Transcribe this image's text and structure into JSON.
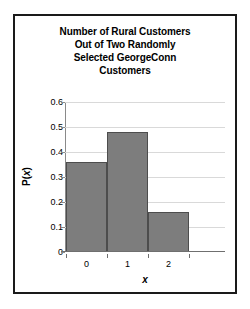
{
  "chart_data": {
    "type": "bar",
    "title": "Number of Rural Customers Out of Two Randomly Selected GeorgeConn Customers",
    "title_lines": [
      "Number of Rural Customers",
      "Out of Two Randomly",
      "Selected GeorgeConn",
      "Customers"
    ],
    "categories": [
      "0",
      "1",
      "2"
    ],
    "values": [
      0.36,
      0.48,
      0.16
    ],
    "xlabel": "x",
    "ylabel": "P(x)",
    "ylim": [
      0,
      0.6
    ],
    "yticks": [
      "0",
      "0.1",
      "0.2",
      "0.3",
      "0.4",
      "0.5",
      "0.6"
    ],
    "ytick_values": [
      0,
      0.1,
      0.2,
      0.3,
      0.4,
      0.5,
      0.6
    ],
    "grid": true,
    "legend": null,
    "colors": {
      "bar_fill": "#7d7d7d",
      "bar_edge": "#4d4d4d",
      "gridline": "#d9d9d9",
      "axis": "#6f6f6f",
      "frame": "#1a1a1a",
      "text": "#000000",
      "background": "#ffffff"
    }
  }
}
